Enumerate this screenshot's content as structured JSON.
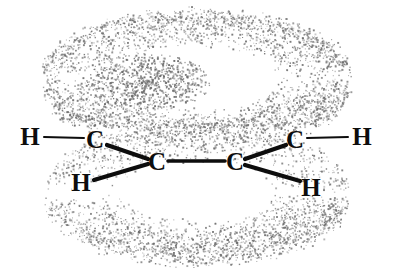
{
  "figure": {
    "name": "ethylene-pi-orbital-diagram",
    "background_color": "#ffffff",
    "width": 394,
    "height": 268
  },
  "molecule": {
    "formula": "C2H4",
    "atoms": [
      {
        "id": "h-upper-left",
        "element": "H",
        "x": 30,
        "y": 137
      },
      {
        "id": "c-upper-left",
        "element": "C",
        "x": 95,
        "y": 140
      },
      {
        "id": "h-lower-left",
        "element": "H",
        "x": 81,
        "y": 183
      },
      {
        "id": "c-center-left",
        "element": "C",
        "x": 157,
        "y": 162
      },
      {
        "id": "c-center-right",
        "element": "C",
        "x": 235,
        "y": 162
      },
      {
        "id": "c-upper-right",
        "element": "C",
        "x": 295,
        "y": 140
      },
      {
        "id": "h-upper-right",
        "element": "H",
        "x": 362,
        "y": 137
      },
      {
        "id": "h-lower-right",
        "element": "H",
        "x": 311,
        "y": 188
      }
    ],
    "bonds": [
      {
        "id": "bond-h-c-upper-left",
        "from": "h-upper-left",
        "to": "c-upper-left",
        "x1": 44,
        "y1": 137,
        "x2": 84,
        "y2": 138,
        "width": 2.0
      },
      {
        "id": "bond-c-c-upper-left",
        "from": "c-upper-left",
        "to": "c-center-left",
        "x1": 107,
        "y1": 145,
        "x2": 148,
        "y2": 159,
        "width": 4.2
      },
      {
        "id": "bond-h-c-lower-left",
        "from": "h-lower-left",
        "to": "c-center-left",
        "x1": 94,
        "y1": 180,
        "x2": 148,
        "y2": 164,
        "width": 4.2
      },
      {
        "id": "bond-c-c-center",
        "from": "c-center-left",
        "to": "c-center-right",
        "x1": 168,
        "y1": 161,
        "x2": 225,
        "y2": 161,
        "width": 3.6
      },
      {
        "id": "bond-c-c-upper-right",
        "from": "c-center-right",
        "to": "c-upper-right",
        "x1": 245,
        "y1": 159,
        "x2": 286,
        "y2": 145,
        "width": 4.2
      },
      {
        "id": "bond-h-c-lower-right",
        "from": "c-center-right",
        "to": "h-lower-right",
        "x1": 245,
        "y1": 165,
        "x2": 300,
        "y2": 181,
        "width": 4.2
      },
      {
        "id": "bond-c-h-upper-right",
        "from": "c-upper-right",
        "to": "h-upper-right",
        "x1": 307,
        "y1": 138,
        "x2": 348,
        "y2": 137,
        "width": 2.0
      }
    ],
    "bond_color": "#0d0d0d"
  },
  "orbitals": {
    "description": "pi molecular orbital shown as two stippled toroidal lobes above and below the molecular plane",
    "stipple_color": "#6b6b6b",
    "lobes": [
      {
        "id": "pi-lobe-upper",
        "position": "above-plane",
        "center_x": 197,
        "center_y": 78,
        "outer_rx": 155,
        "outer_ry": 62,
        "inner_rx": 78,
        "inner_ry": 30,
        "thickness": 40
      },
      {
        "id": "pi-lobe-lower",
        "position": "below-plane",
        "center_x": 197,
        "center_y": 192,
        "outer_rx": 152,
        "outer_ry": 62,
        "inner_rx": 74,
        "inner_ry": 28,
        "thickness": 40
      }
    ]
  }
}
